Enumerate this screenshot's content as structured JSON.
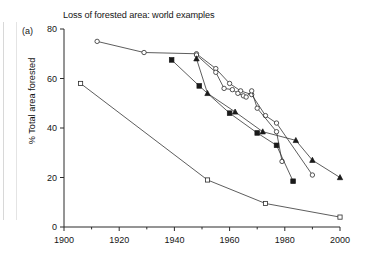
{
  "figure": {
    "panel_label": "(a)",
    "title": "Loss of forested area: world examples",
    "ylabel": "% Total area forested"
  },
  "chart_data": {
    "type": "line",
    "title": "Loss of forested area: world examples",
    "xlabel": "",
    "ylabel": "% Total area forested",
    "xlim": [
      1900,
      2000
    ],
    "ylim": [
      0,
      80
    ],
    "xticks": [
      1900,
      1920,
      1940,
      1960,
      1980,
      2000
    ],
    "xticks_minor": [
      1910,
      1930,
      1950,
      1970,
      1990
    ],
    "yticks": [
      0,
      20,
      40,
      60,
      80
    ],
    "grid": false,
    "legend": "none",
    "series": [
      {
        "name": "open-circle-upper",
        "marker": "open-circle",
        "x": [
          1912,
          1929,
          1948,
          1955,
          1960,
          1964,
          1968,
          1973,
          1977,
          1990
        ],
        "y": [
          75,
          70.5,
          70,
          64,
          58,
          55,
          53.5,
          45,
          42,
          21
        ]
      },
      {
        "name": "open-circle-zigzag",
        "marker": "open-circle",
        "x": [
          1948,
          1955,
          1958,
          1961,
          1963,
          1965,
          1966,
          1968,
          1970,
          1977,
          1979
        ],
        "y": [
          69.5,
          62.5,
          56,
          55.5,
          54,
          53,
          52.5,
          55,
          48,
          38.5,
          26.5
        ]
      },
      {
        "name": "filled-square",
        "marker": "filled-square",
        "x": [
          1939,
          1949,
          1960,
          1970,
          1977,
          1983
        ],
        "y": [
          67.5,
          57,
          46,
          38,
          33,
          18.5
        ]
      },
      {
        "name": "filled-triangle",
        "marker": "filled-triangle",
        "x": [
          1948,
          1952,
          1962,
          1972,
          1984,
          1990,
          2000
        ],
        "y": [
          68,
          54,
          46.5,
          38.5,
          35,
          27,
          20
        ]
      },
      {
        "name": "open-square-lower",
        "marker": "open-square",
        "x": [
          1906,
          1952,
          1973,
          2000
        ],
        "y": [
          58,
          19,
          9.5,
          4
        ]
      }
    ]
  }
}
